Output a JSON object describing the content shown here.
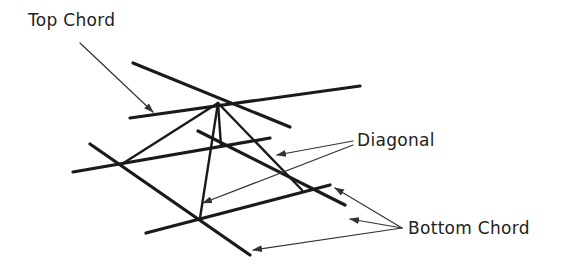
{
  "diagram": {
    "labels": {
      "top_chord": "Top Chord",
      "diagonal": "Diagonal",
      "bottom_chord": "Bottom Chord"
    },
    "colors": {
      "background": "#ffffff",
      "member": "#1a1a1a",
      "leader": "#333333",
      "text": "#222222"
    },
    "nodes": {
      "apex": [
        218,
        103
      ],
      "bottom_left": [
        122,
        164
      ],
      "bottom_front": [
        200,
        218
      ],
      "bottom_right": [
        302,
        190
      ],
      "bottom_back": [
        221,
        146
      ]
    },
    "top_chords": [
      {
        "name": "top-chord-1",
        "from": [
          130,
          118
        ],
        "to": [
          360,
          86
        ]
      },
      {
        "name": "top-chord-2",
        "from": [
          133,
          63
        ],
        "to": [
          290,
          127
        ]
      }
    ],
    "bottom_chords": [
      {
        "name": "bottom-chord-back",
        "from": [
          73,
          172
        ],
        "to": [
          270,
          138
        ]
      },
      {
        "name": "bottom-chord-front",
        "from": [
          146,
          233
        ],
        "to": [
          330,
          185
        ]
      },
      {
        "name": "bottom-chord-left",
        "from": [
          90,
          144
        ],
        "to": [
          250,
          255
        ]
      },
      {
        "name": "bottom-chord-right",
        "from": [
          198,
          131
        ],
        "to": [
          345,
          205
        ]
      }
    ],
    "diagonals": [
      {
        "name": "diagonal-left",
        "from": [
          218,
          103
        ],
        "to": [
          122,
          164
        ]
      },
      {
        "name": "diagonal-front",
        "from": [
          218,
          103
        ],
        "to": [
          200,
          218
        ]
      },
      {
        "name": "diagonal-right",
        "from": [
          218,
          103
        ],
        "to": [
          302,
          190
        ]
      },
      {
        "name": "diagonal-back",
        "from": [
          218,
          103
        ],
        "to": [
          221,
          146
        ]
      }
    ],
    "leaders": [
      {
        "name": "leader-top-chord",
        "from": [
          80,
          43
        ],
        "to": [
          153,
          112
        ]
      },
      {
        "name": "leader-diagonal-1",
        "from": [
          353,
          141
        ],
        "to": [
          277,
          155
        ]
      },
      {
        "name": "leader-diagonal-2",
        "from": [
          353,
          145
        ],
        "to": [
          203,
          203
        ]
      },
      {
        "name": "leader-bottom-chord-1",
        "from": [
          402,
          228
        ],
        "to": [
          335,
          188
        ]
      },
      {
        "name": "leader-bottom-chord-2",
        "from": [
          402,
          228
        ],
        "to": [
          350,
          219
        ]
      },
      {
        "name": "leader-bottom-chord-3",
        "from": [
          402,
          228
        ],
        "to": [
          253,
          250
        ]
      }
    ],
    "label_positions": {
      "top_chord": [
        28,
        12
      ],
      "diagonal": [
        357,
        132
      ],
      "bottom_chord": [
        408,
        220
      ]
    }
  }
}
